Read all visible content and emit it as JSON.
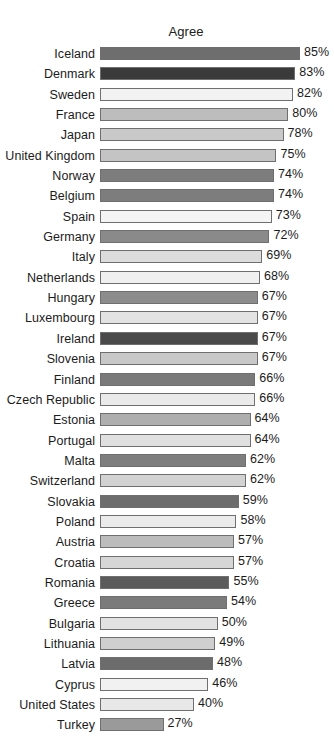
{
  "chart_data": {
    "type": "bar",
    "title": "Agree",
    "xlabel": "",
    "ylabel": "",
    "orientation": "horizontal",
    "value_suffix": "%",
    "xlim": [
      0,
      85
    ],
    "grid": false,
    "legend": "none",
    "categories": [
      "Iceland",
      "Denmark",
      "Sweden",
      "France",
      "Japan",
      "United Kingdom",
      "Norway",
      "Belgium",
      "Spain",
      "Germany",
      "Italy",
      "Netherlands",
      "Hungary",
      "Luxembourg",
      "Ireland",
      "Slovenia",
      "Finland",
      "Czech Republic",
      "Estonia",
      "Portugal",
      "Malta",
      "Switzerland",
      "Slovakia",
      "Poland",
      "Austria",
      "Croatia",
      "Romania",
      "Greece",
      "Bulgaria",
      "Lithuania",
      "Latvia",
      "Cyprus",
      "United States",
      "Turkey"
    ],
    "values": [
      85,
      83,
      82,
      80,
      78,
      75,
      74,
      74,
      73,
      72,
      69,
      68,
      67,
      67,
      67,
      67,
      66,
      66,
      64,
      64,
      62,
      62,
      59,
      58,
      57,
      57,
      55,
      54,
      50,
      49,
      48,
      46,
      40,
      27
    ],
    "value_labels": [
      "85%",
      "83%",
      "82%",
      "80%",
      "78%",
      "75%",
      "74%",
      "74%",
      "73%",
      "72%",
      "69%",
      "68%",
      "67%",
      "67%",
      "67%",
      "67%",
      "66%",
      "66%",
      "64%",
      "64%",
      "62%",
      "62%",
      "59%",
      "58%",
      "57%",
      "57%",
      "55%",
      "54%",
      "50%",
      "49%",
      "48%",
      "46%",
      "40%",
      "27%"
    ],
    "bar_colors": [
      "#6e6e6e",
      "#3a3a3a",
      "#f2f2f2",
      "#bdbdbd",
      "#c9c9c9",
      "#c4c4c4",
      "#7d7d7d",
      "#7d7d7d",
      "#f4f4f4",
      "#8a8a8a",
      "#dcdcdc",
      "#f0f0f0",
      "#8c8c8c",
      "#e3e3e3",
      "#4a4a4a",
      "#c8c8c8",
      "#7a7a7a",
      "#eaeaea",
      "#aeaeae",
      "#e0e0e0",
      "#7e7e7e",
      "#d2d2d2",
      "#6d6d6d",
      "#ebebeb",
      "#bcbcbc",
      "#d6d6d6",
      "#5b5b5b",
      "#7b7b7b",
      "#e2e2e2",
      "#cfcfcf",
      "#6c6c6c",
      "#f1f1f1",
      "#e8e8e8",
      "#9a9a9a"
    ],
    "bar_border_color": "#6f6f6f",
    "background": "#ffffff",
    "text_color": "#1b1b1b"
  }
}
